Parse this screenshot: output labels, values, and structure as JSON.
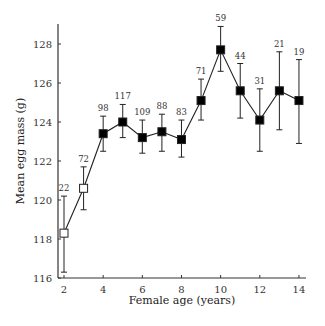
{
  "chart_data": {
    "type": "line",
    "title": "",
    "xlabel": "Female age (years)",
    "ylabel": "Mean egg mass (g)",
    "xlim": [
      2,
      14
    ],
    "ylim": [
      116,
      129
    ],
    "xticks": [
      2,
      4,
      6,
      8,
      10,
      12,
      14
    ],
    "yticks": [
      116,
      118,
      120,
      122,
      124,
      126,
      128
    ],
    "grid": false,
    "legend": null,
    "series": [
      {
        "name": "Mean egg mass",
        "x": [
          2,
          3,
          4,
          5,
          6,
          7,
          8,
          9,
          10,
          11,
          12,
          13,
          14
        ],
        "values": [
          118.3,
          120.6,
          123.4,
          124.0,
          123.2,
          123.5,
          123.1,
          125.1,
          127.7,
          125.6,
          124.1,
          125.6,
          125.1
        ],
        "err_upper": [
          120.2,
          121.7,
          124.3,
          124.9,
          124.1,
          124.4,
          124.1,
          126.2,
          128.9,
          127.0,
          125.7,
          127.6,
          127.2
        ],
        "err_lower": [
          116.3,
          119.5,
          122.5,
          123.2,
          122.4,
          122.5,
          122.2,
          124.1,
          126.6,
          124.2,
          122.5,
          123.6,
          122.9
        ],
        "n": [
          22,
          72,
          98,
          117,
          109,
          88,
          83,
          71,
          59,
          44,
          31,
          21,
          19
        ],
        "marker_fill": [
          "open",
          "open",
          "filled",
          "filled",
          "filled",
          "filled",
          "filled",
          "filled",
          "filled",
          "filled",
          "filled",
          "filled",
          "filled"
        ]
      }
    ],
    "annotations": "Sample sizes shown above each error bar"
  },
  "colors": {
    "line": "#222222",
    "axis": "#333333",
    "marker_filled": "#000000",
    "marker_open": "#ffffff"
  }
}
